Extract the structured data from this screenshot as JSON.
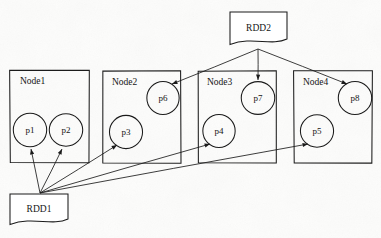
{
  "diagram": {
    "type": "node-partition-diagram",
    "canvas": {
      "width": 381,
      "height": 238
    },
    "background_color": "#fdfdfc",
    "stroke_color": "#1b1b1b"
  },
  "sources": [
    {
      "id": "rdd2",
      "label": "RDD2",
      "shape": "document",
      "x": 230,
      "y": 12,
      "width": 57,
      "height": 31,
      "fan_origin": {
        "x": 258,
        "y": 49
      }
    },
    {
      "id": "rdd1",
      "label": "RDD1",
      "shape": "document",
      "x": 10,
      "y": 194,
      "width": 58,
      "height": 29,
      "fan_origin": {
        "x": 40,
        "y": 193
      }
    }
  ],
  "nodes": [
    {
      "id": "node1",
      "label": "Node1",
      "x": 10,
      "y": 70,
      "width": 79,
      "height": 93,
      "label_x": 20,
      "label_y": 84,
      "partitions": [
        {
          "id": "p1",
          "label": "p1",
          "cx": 30,
          "cy": 130,
          "r": 16.5,
          "source": "rdd1"
        },
        {
          "id": "p2",
          "label": "p2",
          "cx": 66,
          "cy": 130,
          "r": 16.5,
          "source": "rdd1"
        }
      ]
    },
    {
      "id": "node2",
      "label": "Node2",
      "x": 103,
      "y": 71,
      "width": 78,
      "height": 92,
      "label_x": 112,
      "label_y": 85,
      "partitions": [
        {
          "id": "p6",
          "label": "p6",
          "cx": 163,
          "cy": 98,
          "r": 16.5,
          "source": "rdd2"
        },
        {
          "id": "p3",
          "label": "p3",
          "cx": 126,
          "cy": 132,
          "r": 16.5,
          "source": "rdd1"
        }
      ]
    },
    {
      "id": "node3",
      "label": "Node3",
      "x": 198,
      "y": 71,
      "width": 78,
      "height": 92,
      "label_x": 207,
      "label_y": 85,
      "partitions": [
        {
          "id": "p7",
          "label": "p7",
          "cx": 258,
          "cy": 98,
          "r": 16.5,
          "source": "rdd2"
        },
        {
          "id": "p4",
          "label": "p4",
          "cx": 219,
          "cy": 131,
          "r": 16.5,
          "source": "rdd1"
        }
      ]
    },
    {
      "id": "node4",
      "label": "Node4",
      "x": 294,
      "y": 71,
      "width": 78,
      "height": 92,
      "label_x": 303,
      "label_y": 85,
      "partitions": [
        {
          "id": "p8",
          "label": "p8",
          "cx": 355,
          "cy": 98,
          "r": 16.5,
          "source": "rdd2"
        },
        {
          "id": "p5",
          "label": "p5",
          "cx": 317,
          "cy": 131,
          "r": 16.5,
          "source": "rdd1"
        }
      ]
    }
  ],
  "edges": [
    {
      "id": "rdd1-p1",
      "from": "rdd1",
      "to": "p1",
      "x1": 40,
      "y1": 193,
      "x2": 31,
      "y2": 149
    },
    {
      "id": "rdd1-p2",
      "from": "rdd1",
      "to": "p2",
      "x1": 40,
      "y1": 193,
      "x2": 62,
      "y2": 149
    },
    {
      "id": "rdd1-p3",
      "from": "rdd1",
      "to": "p3",
      "x1": 40,
      "y1": 193,
      "x2": 117,
      "y2": 145
    },
    {
      "id": "rdd1-p4",
      "from": "rdd1",
      "to": "p4",
      "x1": 40,
      "y1": 193,
      "x2": 210,
      "y2": 144
    },
    {
      "id": "rdd1-p5",
      "from": "rdd1",
      "to": "p5",
      "x1": 40,
      "y1": 193,
      "x2": 308,
      "y2": 144
    },
    {
      "id": "rdd2-p6",
      "from": "rdd2",
      "to": "p6",
      "x1": 258,
      "y1": 49,
      "x2": 172,
      "y2": 84
    },
    {
      "id": "rdd2-p7",
      "from": "rdd2",
      "to": "p7",
      "x1": 258,
      "y1": 49,
      "x2": 258,
      "y2": 80
    },
    {
      "id": "rdd2-p8",
      "from": "rdd2",
      "to": "p8",
      "x1": 258,
      "y1": 49,
      "x2": 347,
      "y2": 84
    }
  ]
}
